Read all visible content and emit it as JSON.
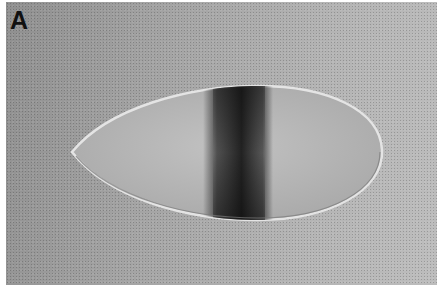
{
  "figure": {
    "panel_label": "A",
    "colors": {
      "background_dark": "#8f8f8f",
      "background_light": "#bdbdbd",
      "embryo_fill": "#b9b9b9",
      "embryo_rim": "#e6e6e6",
      "stripe": "#1e1e1e"
    }
  }
}
